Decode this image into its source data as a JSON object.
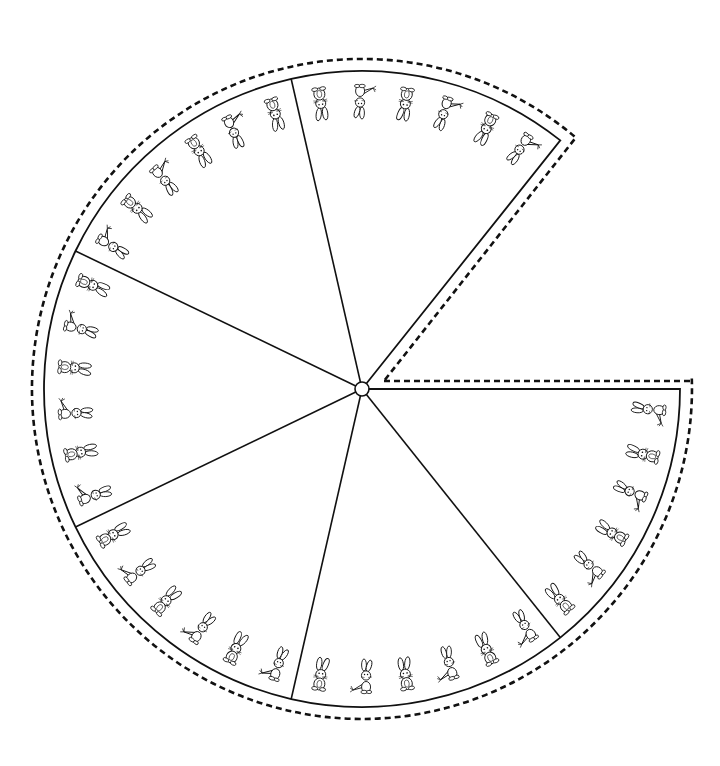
{
  "diagram": {
    "type": "segmented-wheel",
    "center": [
      362,
      389
    ],
    "hub_radius": 7,
    "outer_radius": 318,
    "cut_radius": 330,
    "total_segments": 7,
    "segments_drawn": 6,
    "start_angle_deg": 0,
    "segment_angle_deg": 51.4286,
    "missing_segment": "upper-right wedge (cut away)",
    "cut_line_style": "dashed",
    "divider_style": "solid",
    "stroke_color": "#111111",
    "background_color": "#ffffff",
    "figures_per_segment": 6,
    "figure_types": [
      "sitting-bunny",
      "bunny-with-carrot"
    ],
    "segments": [
      {
        "name": "segment-1",
        "position": "lower-right",
        "figures": [
          "bunny-with-carrot",
          "sitting-bunny",
          "bunny-with-carrot",
          "sitting-bunny",
          "bunny-with-carrot",
          "sitting-bunny"
        ]
      },
      {
        "name": "segment-2",
        "position": "bottom",
        "figures": [
          "bunny-with-carrot",
          "sitting-bunny",
          "bunny-with-carrot",
          "sitting-bunny",
          "bunny-with-carrot",
          "sitting-bunny"
        ]
      },
      {
        "name": "segment-3",
        "position": "lower-left",
        "figures": [
          "bunny-with-carrot",
          "sitting-bunny",
          "bunny-with-carrot",
          "sitting-bunny",
          "bunny-with-carrot",
          "sitting-bunny"
        ]
      },
      {
        "name": "segment-4",
        "position": "left",
        "figures": [
          "bunny-with-carrot",
          "sitting-bunny",
          "bunny-with-carrot",
          "sitting-bunny",
          "bunny-with-carrot",
          "sitting-bunny"
        ]
      },
      {
        "name": "segment-5",
        "position": "upper-left",
        "figures": [
          "bunny-with-carrot",
          "sitting-bunny",
          "bunny-with-carrot",
          "sitting-bunny",
          "bunny-with-carrot",
          "sitting-bunny"
        ]
      },
      {
        "name": "segment-6",
        "position": "top",
        "figures": [
          "sitting-bunny",
          "bunny-with-carrot",
          "sitting-bunny",
          "bunny-with-carrot",
          "sitting-bunny",
          "bunny-with-carrot"
        ]
      }
    ]
  }
}
